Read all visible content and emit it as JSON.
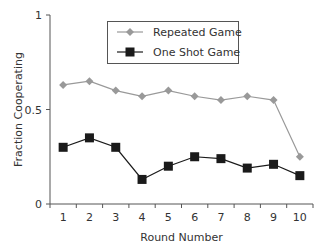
{
  "chart_data": {
    "type": "line",
    "title": "",
    "xlabel": "Round Number",
    "ylabel": "Fraction Cooperating",
    "x": [
      1,
      2,
      3,
      4,
      5,
      6,
      7,
      8,
      9,
      10
    ],
    "x_tick_labels": [
      "1",
      "2",
      "3",
      "4",
      "5",
      "6",
      "7",
      "8",
      "9",
      "10"
    ],
    "y_tick_labels": [
      "0",
      "0.5",
      "1"
    ],
    "y_ticks": [
      0,
      0.5,
      1
    ],
    "ylim": [
      0,
      1
    ],
    "grid": false,
    "legend_position": "upper center (inside plot, boxed)",
    "series": [
      {
        "name": "Repeated Game",
        "marker": "diamond",
        "color": "#999999",
        "values": [
          0.63,
          0.65,
          0.6,
          0.57,
          0.6,
          0.57,
          0.55,
          0.57,
          0.55,
          0.25
        ]
      },
      {
        "name": "One Shot Game",
        "marker": "square",
        "color": "#1a1a1a",
        "values": [
          0.3,
          0.35,
          0.3,
          0.13,
          0.2,
          0.25,
          0.24,
          0.19,
          0.21,
          0.15
        ]
      }
    ]
  }
}
